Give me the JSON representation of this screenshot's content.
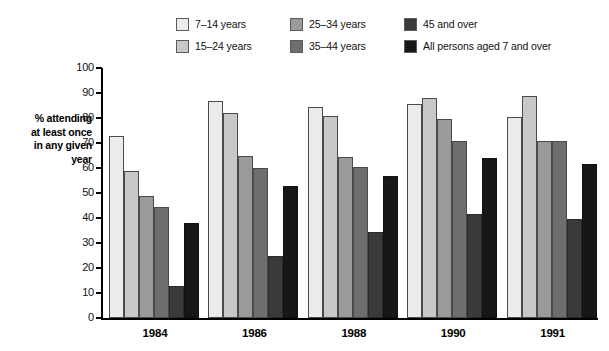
{
  "chart_data": {
    "type": "bar",
    "title": "",
    "xlabel": "",
    "ylabel": "% attending at least once in any given year",
    "ylim": [
      0,
      100
    ],
    "ytick_step": 10,
    "grid": false,
    "legend_position": "top",
    "categories": [
      "1984",
      "1986",
      "1988",
      "1990",
      "1991"
    ],
    "series": [
      {
        "name": "7–14 years",
        "color": "#ebebeb",
        "values": [
          73,
          87,
          84.5,
          85.5,
          80.5
        ]
      },
      {
        "name": "15–24 years",
        "color": "#c8c8c8",
        "values": [
          59,
          82,
          81,
          88,
          89
        ]
      },
      {
        "name": "25–34 years",
        "color": "#9a9a9a",
        "values": [
          49,
          65,
          64.5,
          79.5,
          71
        ]
      },
      {
        "name": "35–44 years",
        "color": "#6e6e6e",
        "values": [
          44.5,
          60,
          60.5,
          71,
          71
        ]
      },
      {
        "name": "45 and over",
        "color": "#3a3a3a",
        "values": [
          13,
          25,
          34.5,
          41.5,
          39.5
        ]
      },
      {
        "name": "All persons aged 7 and over",
        "color": "#171717",
        "values": [
          38,
          53,
          57,
          64,
          61.5
        ]
      }
    ]
  },
  "y_axis": {
    "ticks": [
      "100",
      "90",
      "80",
      "70",
      "60",
      "50",
      "40",
      "30",
      "20",
      "10",
      "0"
    ],
    "title_lines": [
      "% attending",
      "at least once",
      "in any given",
      "year"
    ]
  },
  "legend": {
    "items": [
      {
        "label": "7–14 years",
        "color": "#ebebeb"
      },
      {
        "label": "25–34 years",
        "color": "#9a9a9a"
      },
      {
        "label": "45 and over",
        "color": "#3a3a3a"
      },
      {
        "label": "15–24 years",
        "color": "#c8c8c8"
      },
      {
        "label": "35–44 years",
        "color": "#6e6e6e"
      },
      {
        "label": "All persons aged 7 and over",
        "color": "#171717"
      }
    ]
  }
}
